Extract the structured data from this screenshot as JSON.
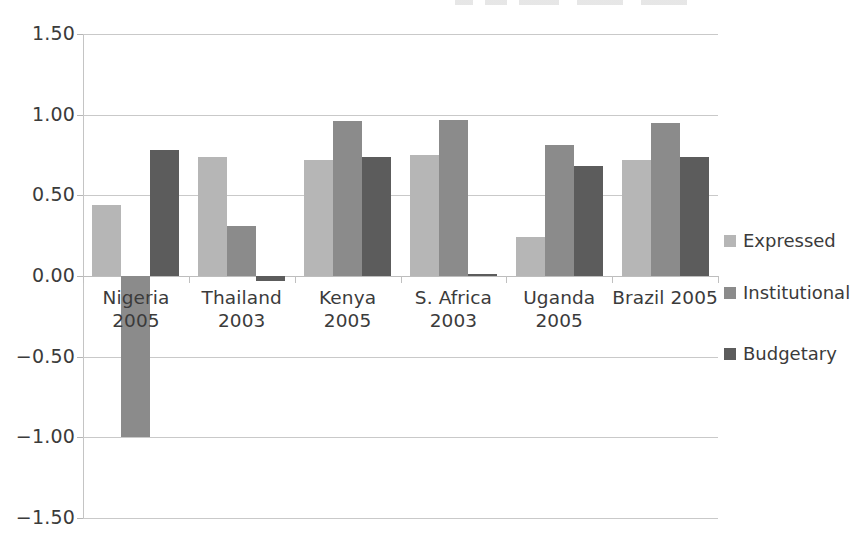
{
  "chart_data": {
    "type": "bar",
    "title": "",
    "xlabel": "",
    "ylabel": "",
    "ylim": [
      -1.5,
      1.5
    ],
    "ytick_labels": [
      "1.50",
      "1.00",
      "0.50",
      "0.00",
      "-0.50",
      "-1.00",
      "-1.50"
    ],
    "ytick_values": [
      1.5,
      1.0,
      0.5,
      0.0,
      -0.5,
      -1.0,
      -1.5
    ],
    "grid": true,
    "legend_position": "right",
    "categories": [
      "Nigeria 2005",
      "Thailand 2003",
      "Kenya 2005",
      "S. Africa 2003",
      "Uganda 2005",
      "Brazil 2005"
    ],
    "series": [
      {
        "name": "Expressed",
        "color": "#b6b6b6",
        "values": [
          0.44,
          0.74,
          0.72,
          0.75,
          0.24,
          0.72
        ]
      },
      {
        "name": "Institutional",
        "color": "#8b8b8b",
        "values": [
          -1.0,
          0.31,
          0.96,
          0.97,
          0.81,
          0.95
        ]
      },
      {
        "name": "Budgetary",
        "color": "#5c5c5c",
        "values": [
          0.78,
          -0.03,
          0.74,
          0.01,
          0.68,
          0.74
        ]
      }
    ]
  },
  "legend": {
    "items": [
      {
        "label": "Expressed",
        "color": "#b6b6b6"
      },
      {
        "label": "Institutional",
        "color": "#8b8b8b"
      },
      {
        "label": "Budgetary",
        "color": "#5c5c5c"
      }
    ]
  }
}
